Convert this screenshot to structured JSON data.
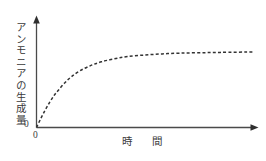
{
  "chart_data": {
    "type": "line",
    "title": "",
    "xlabel": "時　間",
    "ylabel": "アンモニアの生成量",
    "origin_label_y": "0",
    "origin_label_x": "0",
    "grid": false,
    "legend": false,
    "axis_style": "arrow",
    "line_style": "dashed",
    "line_color": "#333333",
    "axis_color": "#4a4a4a",
    "background_color": "#ffffff",
    "xlim": [
      0,
      1
    ],
    "ylim": [
      0,
      1
    ],
    "x_ticks": [],
    "y_ticks": [],
    "series": [
      {
        "name": "アンモニアの生成量",
        "description": "時間とともに増加し一定値に漸近する飽和曲線",
        "x": [
          0.0,
          0.02,
          0.04,
          0.06,
          0.08,
          0.1,
          0.13,
          0.16,
          0.2,
          0.25,
          0.3,
          0.36,
          0.42,
          0.5,
          0.58,
          0.66,
          0.75,
          0.85,
          1.0
        ],
        "y": [
          0.0,
          0.12,
          0.23,
          0.33,
          0.42,
          0.49,
          0.59,
          0.67,
          0.75,
          0.82,
          0.87,
          0.91,
          0.94,
          0.96,
          0.975,
          0.985,
          0.99,
          0.995,
          1.0
        ]
      }
    ],
    "annotations": []
  }
}
